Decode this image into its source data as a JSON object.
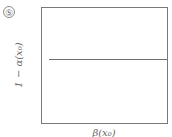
{
  "panel": {
    "label": "⑤"
  },
  "chart_data": {
    "type": "line",
    "title": "",
    "xlabel": "β(x₀)",
    "ylabel": "1 − α(x₀)",
    "series": [
      {
        "name": "constant",
        "x": [
          0,
          1
        ],
        "values": [
          0.56,
          0.56
        ]
      }
    ],
    "xlim": [
      0,
      1
    ],
    "ylim": [
      0,
      1
    ],
    "grid": false,
    "ticks": false,
    "legend": null
  },
  "axes": {
    "xlabel": "β(x₀)",
    "ylabel": "1 − α(x₀)"
  }
}
